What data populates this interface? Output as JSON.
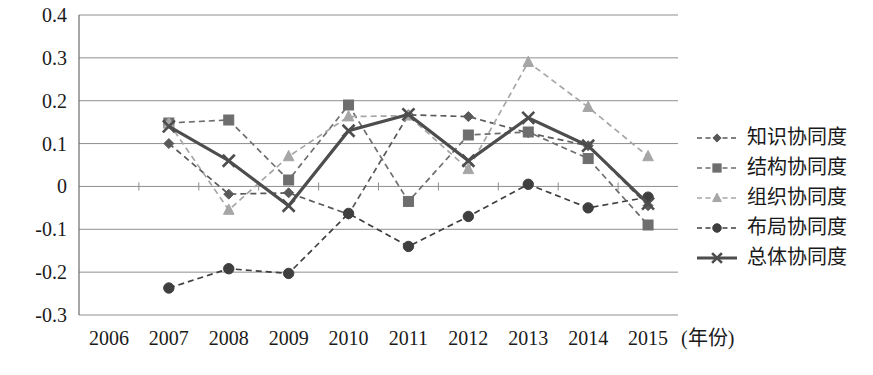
{
  "chart_data": {
    "type": "line",
    "title": "",
    "xlabel": "(年份)",
    "ylabel": "",
    "categories": [
      "2006",
      "2007",
      "2008",
      "2009",
      "2010",
      "2011",
      "2012",
      "2013",
      "2014",
      "2015"
    ],
    "ylim": [
      -0.3,
      0.4
    ],
    "yticks": [
      "0.4",
      "0.3",
      "0.2",
      "0.1",
      "0",
      "-0.1",
      "-0.2",
      "-0.3"
    ],
    "ytick_values": [
      0.4,
      0.3,
      0.2,
      0.1,
      0,
      -0.1,
      -0.2,
      -0.3
    ],
    "grid": true,
    "legend_position": "right",
    "series": [
      {
        "name": "知识协同度",
        "marker": "diamond",
        "line": "dashed",
        "color": "#595959",
        "x": [
          "2007",
          "2008",
          "2009",
          "2010",
          "2011",
          "2012",
          "2013",
          "2014",
          "2015"
        ],
        "values": [
          0.1,
          -0.018,
          -0.015,
          -0.065,
          0.167,
          0.163,
          0.125,
          0.095,
          -0.045
        ]
      },
      {
        "name": "结构协同度",
        "marker": "square",
        "line": "dashed",
        "color": "#6e6e6e",
        "x": [
          "2007",
          "2008",
          "2009",
          "2010",
          "2011",
          "2012",
          "2013",
          "2014",
          "2015"
        ],
        "values": [
          0.148,
          0.155,
          0.015,
          0.19,
          -0.035,
          0.12,
          0.127,
          0.065,
          -0.09
        ]
      },
      {
        "name": "组织协同度",
        "marker": "triangle",
        "line": "dashed",
        "color": "#a6a6a6",
        "x": [
          "2007",
          "2008",
          "2009",
          "2010",
          "2011",
          "2012",
          "2013",
          "2014",
          "2015"
        ],
        "values": [
          0.148,
          -0.055,
          0.07,
          0.163,
          0.165,
          0.04,
          0.29,
          0.185,
          0.07
        ]
      },
      {
        "name": "布局协同度",
        "marker": "circle",
        "line": "dashed",
        "color": "#3f3f3f",
        "x": [
          "2007",
          "2008",
          "2009",
          "2010",
          "2011",
          "2012",
          "2013",
          "2014",
          "2015"
        ],
        "values": [
          -0.237,
          -0.192,
          -0.203,
          -0.063,
          -0.14,
          -0.07,
          0.005,
          -0.05,
          -0.025
        ]
      },
      {
        "name": "总体协同度",
        "marker": "x",
        "line": "solid",
        "color": "#4d4d4d",
        "x": [
          "2007",
          "2008",
          "2009",
          "2010",
          "2011",
          "2012",
          "2013",
          "2014",
          "2015"
        ],
        "values": [
          0.14,
          0.06,
          -0.045,
          0.13,
          0.168,
          0.06,
          0.16,
          0.095,
          -0.04
        ]
      }
    ]
  }
}
